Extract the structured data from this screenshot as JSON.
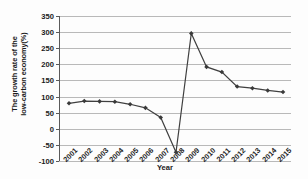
{
  "chart_data": {
    "type": "line",
    "title": "",
    "xlabel": "Year",
    "ylabel": "The growth rate of the low-carbon economy(%)",
    "ylabel_line1": "The growth rate of the",
    "ylabel_line2": "low-carbon economy(%)",
    "categories": [
      "2001",
      "2002",
      "2003",
      "2004",
      "2005",
      "2006",
      "2007",
      "2008",
      "2009",
      "2010",
      "2011",
      "2012",
      "2013",
      "2014",
      "2015"
    ],
    "values": [
      79,
      86,
      85,
      84,
      76,
      65,
      35,
      -73,
      296,
      192,
      176,
      131,
      126,
      119,
      114
    ],
    "series": [
      {
        "name": "The growth rate of the low-carbon economy(%)",
        "values": [
          79,
          86,
          85,
          84,
          76,
          65,
          35,
          -73,
          296,
          192,
          176,
          131,
          126,
          119,
          114
        ]
      }
    ],
    "yticks": [
      350,
      300,
      250,
      200,
      150,
      100,
      50,
      0,
      -50,
      -100
    ],
    "ytick_labels": [
      "350",
      "300",
      "250",
      "200",
      "150",
      "100",
      "50",
      "0",
      "-50",
      "-100"
    ],
    "ylim": [
      -100,
      350
    ],
    "grid": true,
    "legend": false,
    "marker": "diamond",
    "line_color": "#404040",
    "marker_color": "#3a3a3a",
    "grid_color": "#b9b9b9",
    "axis_color": "#5a5a5a"
  }
}
